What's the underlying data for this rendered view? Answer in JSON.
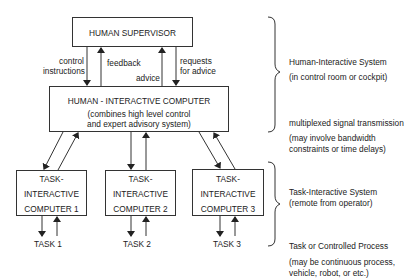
{
  "diagram": {
    "supervisor": {
      "label": "HUMAN SUPERVISOR"
    },
    "human_computer": {
      "title": "HUMAN - INTERACTIVE COMPUTER",
      "desc_line1": "(combines high level control",
      "desc_line2": "and expert advisory system)"
    },
    "links_top": {
      "control_1": "control",
      "control_2": "instructions",
      "feedback": "feedback",
      "advice": "advice",
      "requests_1": "requests",
      "requests_2": "for  advice"
    },
    "task_computers": [
      {
        "line1": "TASK-",
        "line2": "INTERACTIVE",
        "line3": "COMPUTER   1",
        "task": "TASK  1"
      },
      {
        "line1": "TASK-",
        "line2": "INTERACTIVE",
        "line3": "COMPUTER  2",
        "task": "TASK  2"
      },
      {
        "line1": "TASK-",
        "line2": "INTERACTIVE",
        "line3": "COMPUTER  3",
        "task": "TASK  3"
      }
    ],
    "annotations": {
      "his_title": "Human-Interactive System",
      "his_sub": "(in control room or cockpit)",
      "mux_title": "multiplexed signal transmission",
      "mux_sub1": "(may involve bandwidth",
      "mux_sub2": " constraints or time delays)",
      "tis_title": "Task-Interactive System",
      "tis_sub": "(remote from operator)",
      "task_title": "Task or Controlled Process",
      "task_sub1": "(may be continuous process,",
      "task_sub2": " vehicle, robot, or etc.)"
    },
    "colors": {
      "line": "#333333",
      "text": "#222222",
      "background": "#ffffff"
    }
  }
}
